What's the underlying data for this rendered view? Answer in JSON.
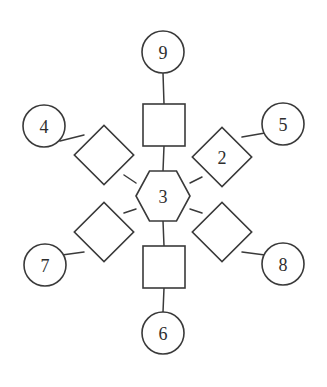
{
  "diagram": {
    "background_color": "#ffffff",
    "stroke_color": "#3a3a3a",
    "fill_color": "#ffffff",
    "label_color": "#2e2e2e",
    "center": {
      "id": "center",
      "shape": "hexagon",
      "label": "3",
      "cx": 163,
      "cy": 196,
      "rx": 27,
      "ry": 25
    },
    "nodes": [
      {
        "id": "square-top",
        "shape": "square",
        "label": "",
        "cx": 164,
        "cy": 125,
        "size": 42,
        "rotation": 0
      },
      {
        "id": "circle-9",
        "shape": "circle",
        "label": "9",
        "cx": 163,
        "cy": 52,
        "r": 21,
        "rotation": 0
      },
      {
        "id": "diamond-upper-left",
        "shape": "diamond",
        "label": "",
        "cx": 104,
        "cy": 155,
        "size": 42,
        "rotation": 45
      },
      {
        "id": "circle-4",
        "shape": "circle",
        "label": "4",
        "cx": 44,
        "cy": 126,
        "r": 21,
        "rotation": 0
      },
      {
        "id": "diamond-2",
        "shape": "diamond",
        "label": "2",
        "cx": 222,
        "cy": 157,
        "size": 42,
        "rotation": 45
      },
      {
        "id": "circle-5",
        "shape": "circle",
        "label": "5",
        "cx": 283,
        "cy": 124,
        "r": 21,
        "rotation": 0
      },
      {
        "id": "diamond-lower-left",
        "shape": "diamond",
        "label": "",
        "cx": 104,
        "cy": 232,
        "size": 42,
        "rotation": 45
      },
      {
        "id": "circle-7",
        "shape": "circle",
        "label": "7",
        "cx": 45,
        "cy": 265,
        "r": 21,
        "rotation": 0
      },
      {
        "id": "diamond-lower-right",
        "shape": "diamond",
        "label": "",
        "cx": 222,
        "cy": 232,
        "size": 42,
        "rotation": 45
      },
      {
        "id": "circle-8",
        "shape": "circle",
        "label": "8",
        "cx": 283,
        "cy": 264,
        "r": 21,
        "rotation": 0
      },
      {
        "id": "square-bottom",
        "shape": "square",
        "label": "",
        "cx": 164,
        "cy": 267,
        "size": 42,
        "rotation": 0
      },
      {
        "id": "circle-6",
        "shape": "circle",
        "label": "6",
        "cx": 163,
        "cy": 333,
        "r": 21,
        "rotation": 0
      }
    ],
    "edges": [
      {
        "id": "edge-center-square-top",
        "from": "center",
        "to": "square-top",
        "x1": 163,
        "y1": 171,
        "x2": 164,
        "y2": 146
      },
      {
        "id": "edge-square-top-circle-9",
        "from": "square-top",
        "to": "circle-9",
        "x1": 164,
        "y1": 104,
        "x2": 163,
        "y2": 73
      },
      {
        "id": "edge-center-diamond-upper-left",
        "from": "center",
        "to": "diamond-upper-left",
        "x1": 136,
        "y1": 183,
        "x2": 124,
        "y2": 175
      },
      {
        "id": "edge-diamond-upper-left-circle-4",
        "from": "diamond-upper-left",
        "to": "circle-4",
        "x1": 84,
        "y1": 135,
        "x2": 60,
        "y2": 141
      },
      {
        "id": "edge-center-diamond-2",
        "from": "center",
        "to": "diamond-2",
        "x1": 190,
        "y1": 183,
        "x2": 202,
        "y2": 177
      },
      {
        "id": "edge-diamond-2-circle-5",
        "from": "diamond-2",
        "to": "circle-5",
        "x1": 242,
        "y1": 137,
        "x2": 265,
        "y2": 133
      },
      {
        "id": "edge-center-diamond-lower-left",
        "from": "center",
        "to": "diamond-lower-left",
        "x1": 136,
        "y1": 209,
        "x2": 124,
        "y2": 213
      },
      {
        "id": "edge-diamond-lower-left-circle-7",
        "from": "diamond-lower-left",
        "to": "circle-7",
        "x1": 84,
        "y1": 252,
        "x2": 62,
        "y2": 255
      },
      {
        "id": "edge-center-diamond-lower-right",
        "from": "center",
        "to": "diamond-lower-right",
        "x1": 190,
        "y1": 209,
        "x2": 202,
        "y2": 213
      },
      {
        "id": "edge-diamond-lower-right-circle-8",
        "from": "diamond-lower-right",
        "to": "circle-8",
        "x1": 242,
        "y1": 252,
        "x2": 265,
        "y2": 255
      },
      {
        "id": "edge-center-square-bottom",
        "from": "center",
        "to": "square-bottom",
        "x1": 163,
        "y1": 221,
        "x2": 164,
        "y2": 246
      },
      {
        "id": "edge-square-bottom-circle-6",
        "from": "square-bottom",
        "to": "circle-6",
        "x1": 164,
        "y1": 288,
        "x2": 163,
        "y2": 312
      }
    ]
  }
}
